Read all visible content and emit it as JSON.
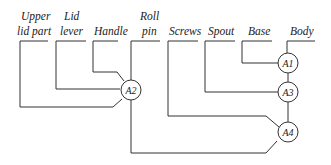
{
  "diagram": {
    "type": "assembly-sequence-tree",
    "parts": [
      {
        "id": "upper_lid_part",
        "lines": [
          "Upper",
          "lid part"
        ]
      },
      {
        "id": "lid_lever",
        "lines": [
          "Lid",
          "lever"
        ]
      },
      {
        "id": "handle",
        "lines": [
          "Handle"
        ]
      },
      {
        "id": "roll_pin",
        "lines": [
          "Roll",
          "pin"
        ]
      },
      {
        "id": "screws",
        "lines": [
          "Screws"
        ]
      },
      {
        "id": "spout",
        "lines": [
          "Spout"
        ]
      },
      {
        "id": "base",
        "lines": [
          "Base"
        ]
      },
      {
        "id": "body",
        "lines": [
          "Body"
        ]
      }
    ],
    "nodes": [
      {
        "id": "A1",
        "label": "A1",
        "inputs": [
          "base",
          "body"
        ]
      },
      {
        "id": "A2",
        "label": "A2",
        "inputs": [
          "upper_lid_part",
          "lid_lever",
          "handle",
          "roll_pin"
        ]
      },
      {
        "id": "A3",
        "label": "A3",
        "inputs": [
          "spout",
          "A1"
        ]
      },
      {
        "id": "A4",
        "label": "A4",
        "inputs": [
          "screws",
          "A3",
          "A2"
        ]
      }
    ],
    "colors": {
      "line": "#333333",
      "text": "#222222",
      "background": "#ffffff"
    }
  }
}
